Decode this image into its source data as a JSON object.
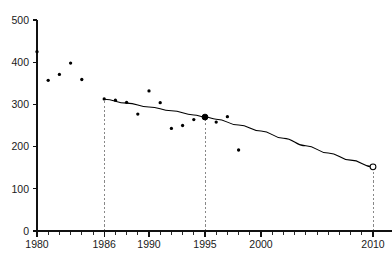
{
  "chart_data": {
    "type": "scatter",
    "title": "",
    "subtitle": "",
    "xlabel": "",
    "ylabel": "",
    "xlim": [
      1980,
      2010
    ],
    "ylim": [
      0,
      500
    ],
    "grid": false,
    "legend": null,
    "x_ticks_major": [
      1980,
      1986,
      1990,
      1995,
      2000,
      2010
    ],
    "x_tick_labels": [
      "1980",
      "1986",
      "1990",
      "1995",
      "2000",
      "2010"
    ],
    "x_ticks_minor_step": 1,
    "y_ticks": [
      0,
      100,
      200,
      300,
      400,
      500
    ],
    "y_tick_labels": [
      "0",
      "100",
      "200",
      "300",
      "400",
      "500"
    ],
    "series": [
      {
        "name": "observations",
        "type": "scatter",
        "marker": "filled-circle",
        "color": "#000000",
        "points": [
          {
            "x": 1980,
            "y": 425
          },
          {
            "x": 1981,
            "y": 357
          },
          {
            "x": 1982,
            "y": 371
          },
          {
            "x": 1983,
            "y": 398
          },
          {
            "x": 1984,
            "y": 359
          },
          {
            "x": 1986,
            "y": 313
          },
          {
            "x": 1987,
            "y": 310
          },
          {
            "x": 1988,
            "y": 305
          },
          {
            "x": 1989,
            "y": 277
          },
          {
            "x": 1990,
            "y": 332
          },
          {
            "x": 1991,
            "y": 304
          },
          {
            "x": 1992,
            "y": 243
          },
          {
            "x": 1993,
            "y": 250
          },
          {
            "x": 1994,
            "y": 264
          },
          {
            "x": 1995,
            "y": 268
          },
          {
            "x": 1996,
            "y": 258
          },
          {
            "x": 1997,
            "y": 271
          },
          {
            "x": 1998,
            "y": 192
          }
        ]
      },
      {
        "name": "trend",
        "type": "line",
        "color": "#000000",
        "points": [
          {
            "x": 1986,
            "y": 312
          },
          {
            "x": 1988,
            "y": 303
          },
          {
            "x": 1990,
            "y": 294
          },
          {
            "x": 1992,
            "y": 285
          },
          {
            "x": 1994,
            "y": 275
          },
          {
            "x": 1995,
            "y": 270
          },
          {
            "x": 1996,
            "y": 265
          },
          {
            "x": 1998,
            "y": 251
          },
          {
            "x": 2000,
            "y": 237
          },
          {
            "x": 2002,
            "y": 220
          },
          {
            "x": 2004,
            "y": 202
          },
          {
            "x": 2006,
            "y": 185
          },
          {
            "x": 2008,
            "y": 168
          },
          {
            "x": 2010,
            "y": 152
          }
        ]
      }
    ],
    "highlight_markers": [
      {
        "name": "marker-1995",
        "x": 1995,
        "y": 270,
        "style": "filled-circle",
        "color": "#000000"
      },
      {
        "name": "marker-2010",
        "x": 2010,
        "y": 152,
        "style": "open-circle",
        "color": "#000000"
      }
    ],
    "reference_lines": [
      {
        "name": "reference-1986",
        "x": 1986,
        "style": "dashed",
        "color": "#888888",
        "from_y": 0,
        "to_y": 312
      },
      {
        "name": "reference-1995",
        "x": 1995,
        "style": "dashed",
        "color": "#888888",
        "from_y": 0,
        "to_y": 270
      },
      {
        "name": "reference-2010",
        "x": 2010,
        "style": "dashed",
        "color": "#888888",
        "from_y": 0,
        "to_y": 152
      }
    ],
    "annotations": []
  },
  "axes": {
    "y_axis_name": "y-axis",
    "x_axis_name": "x-axis"
  }
}
